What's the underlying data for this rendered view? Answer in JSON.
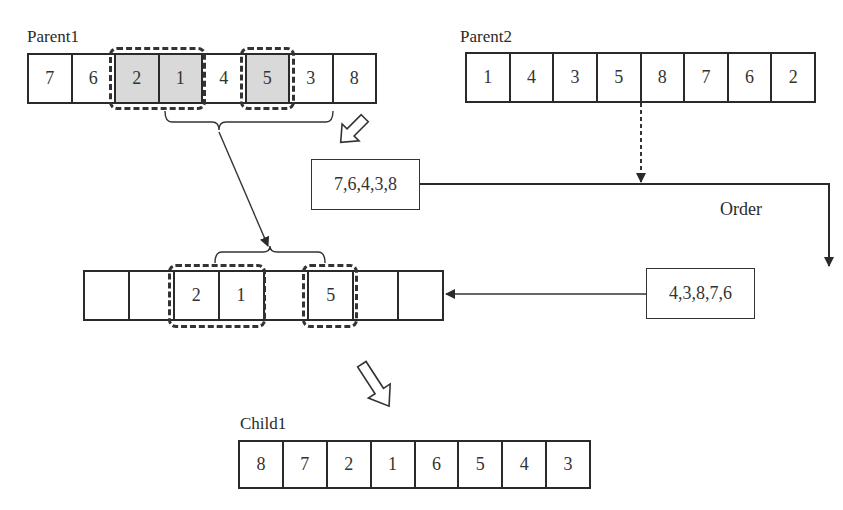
{
  "parent1": {
    "label": "Parent1",
    "genes": [
      "7",
      "6",
      "2",
      "1",
      "4",
      "5",
      "3",
      "8"
    ],
    "selected_indices": [
      2,
      3,
      5
    ]
  },
  "parent2": {
    "label": "Parent2",
    "genes": [
      "1",
      "4",
      "3",
      "5",
      "8",
      "7",
      "6",
      "2"
    ]
  },
  "remaining_box": {
    "text": "7,6,4,3,8"
  },
  "ordered_box": {
    "text": "4,3,8,7,6"
  },
  "order_label": "Order",
  "intermediate": {
    "genes": [
      "",
      "",
      "2",
      "1",
      "",
      "5",
      "",
      ""
    ]
  },
  "child1": {
    "label": "Child1",
    "genes": [
      "8",
      "7",
      "2",
      "1",
      "6",
      "5",
      "4",
      "3"
    ]
  },
  "icons": {
    "hollow_arrow_1": "hollow-down-right-arrow",
    "hollow_arrow_2": "hollow-down-right-arrow"
  },
  "colors": {
    "stroke": "#2a2a2a",
    "shaded_cell": "#d9d9d9",
    "background": "#ffffff"
  }
}
